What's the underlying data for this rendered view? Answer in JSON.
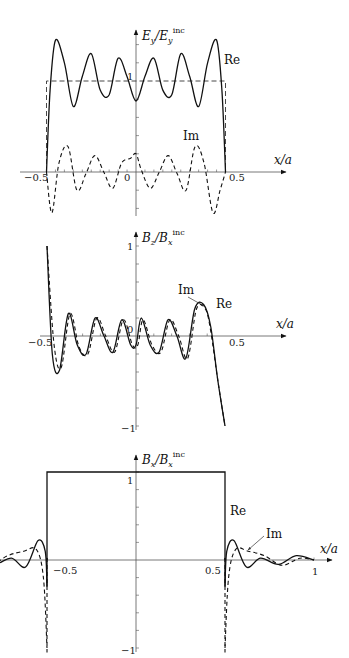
{
  "chart_data": [
    {
      "type": "line",
      "title": "",
      "ylabel": "E_y/E_y^inc",
      "ylabel_main": "E",
      "ylabel_sub": "y",
      "ylabel_den": "/E",
      "ylabel_den_sub": "y",
      "ylabel_sup": "inc",
      "xlabel": "x/a",
      "xticks": [
        "-0.5",
        "0",
        "0.5"
      ],
      "yticks": [
        "1"
      ],
      "xlim": [
        -0.5,
        0.5
      ],
      "ylim": [
        -0.5,
        1.55
      ],
      "reference": {
        "name": "incident",
        "style": "dashed",
        "value": 1,
        "x_range": [
          -0.5,
          0.5
        ]
      },
      "series": [
        {
          "name": "Re",
          "style": "solid",
          "x": [
            -0.5,
            -0.48,
            -0.45,
            -0.4,
            -0.35,
            -0.3,
            -0.25,
            -0.2,
            -0.15,
            -0.1,
            -0.05,
            0,
            0.05,
            0.1,
            0.15,
            0.2,
            0.25,
            0.3,
            0.35,
            0.4,
            0.45,
            0.48,
            0.5
          ],
          "values": [
            0,
            0.9,
            1.45,
            1.2,
            0.72,
            1.05,
            1.3,
            0.9,
            0.85,
            1.25,
            1.05,
            0.78,
            1.05,
            1.25,
            0.9,
            0.85,
            1.3,
            1.05,
            0.72,
            1.2,
            1.45,
            0.9,
            0
          ]
        },
        {
          "name": "Im",
          "style": "dashed",
          "x": [
            -0.5,
            -0.47,
            -0.43,
            -0.38,
            -0.33,
            -0.28,
            -0.23,
            -0.18,
            -0.13,
            -0.08,
            -0.03,
            0,
            0.03,
            0.08,
            0.13,
            0.18,
            0.23,
            0.28,
            0.33,
            0.38,
            0.43,
            0.47,
            0.5
          ],
          "values": [
            0,
            -0.45,
            0.1,
            0.28,
            -0.2,
            -0.02,
            0.18,
            0.0,
            -0.18,
            0.1,
            0.15,
            0.2,
            0.02,
            -0.18,
            0.0,
            0.18,
            -0.02,
            -0.2,
            0.28,
            0.1,
            -0.45,
            -0.2,
            0
          ]
        }
      ]
    },
    {
      "type": "line",
      "title": "",
      "ylabel": "B_z/B_x^inc",
      "ylabel_main": "B",
      "ylabel_sub": "z",
      "ylabel_den": "/B",
      "ylabel_den_sub": "x",
      "ylabel_sup": "inc",
      "xlabel": "x/a",
      "xticks": [
        "-0.5",
        "0",
        "0.5"
      ],
      "yticks": [
        "1",
        "-1"
      ],
      "xlim": [
        -0.5,
        0.5
      ],
      "ylim": [
        -1,
        1
      ],
      "annotations": [
        {
          "text": "Im",
          "arrow": true
        },
        {
          "text": "Re"
        }
      ],
      "series": [
        {
          "name": "Re",
          "style": "solid",
          "x": [
            -0.5,
            -0.47,
            -0.43,
            -0.38,
            -0.33,
            -0.28,
            -0.23,
            -0.18,
            -0.13,
            -0.08,
            -0.03,
            0.0,
            0.03,
            0.08,
            0.13,
            0.18,
            0.23,
            0.28,
            0.33,
            0.38,
            0.42,
            0.46,
            0.5
          ],
          "values": [
            1.0,
            -0.2,
            -0.38,
            0.25,
            -0.1,
            -0.2,
            0.2,
            0.0,
            -0.18,
            0.18,
            -0.1,
            -0.1,
            0.2,
            -0.1,
            -0.18,
            0.18,
            0.0,
            -0.25,
            0.3,
            0.35,
            0.1,
            -0.5,
            -1.0
          ]
        },
        {
          "name": "Im",
          "style": "dashed",
          "x": [
            -0.5,
            -0.46,
            -0.42,
            -0.37,
            -0.32,
            -0.27,
            -0.22,
            -0.17,
            -0.12,
            -0.07,
            -0.02,
            0.01,
            0.04,
            0.09,
            0.14,
            0.19,
            0.24,
            0.29,
            0.34,
            0.39,
            0.42,
            0.46,
            0.5
          ],
          "values": [
            1.0,
            -0.1,
            -0.35,
            0.25,
            -0.12,
            -0.2,
            0.2,
            0.0,
            -0.18,
            0.18,
            -0.1,
            -0.1,
            0.18,
            -0.1,
            -0.18,
            0.18,
            0.0,
            -0.25,
            0.3,
            0.3,
            0.05,
            -0.5,
            -1.0
          ]
        }
      ]
    },
    {
      "type": "line",
      "title": "",
      "ylabel": "B_x/B_x^inc",
      "ylabel_main": "B",
      "ylabel_sub": "x",
      "ylabel_den": "/B",
      "ylabel_den_sub": "x",
      "ylabel_sup": "inc",
      "xlabel": "x/a",
      "xticks": [
        "-0.5",
        "0.5",
        "1"
      ],
      "yticks": [
        "1",
        "-1"
      ],
      "xlim": [
        -1,
        1
      ],
      "ylim": [
        -1,
        1.05
      ],
      "reference": {
        "name": "incident",
        "style": "solid",
        "value": 1,
        "x_range": [
          -0.5,
          0.5
        ]
      },
      "annotations": [
        {
          "text": "Re"
        },
        {
          "text": "Im",
          "arrow": true
        }
      ],
      "series": [
        {
          "name": "Re",
          "style": "solid",
          "x": [
            -1.0,
            -0.9,
            -0.8,
            -0.7,
            -0.62,
            -0.55,
            -0.51,
            -0.5,
            0.5,
            0.51,
            0.55,
            0.62,
            0.7,
            0.8,
            0.9,
            1.0
          ],
          "values": [
            0.0,
            0.05,
            -0.05,
            0.02,
            -0.08,
            0.22,
            0.1,
            -0.3,
            -0.3,
            0.1,
            0.22,
            -0.08,
            0.02,
            -0.05,
            0.05,
            0.0
          ]
        },
        {
          "name": "Im",
          "style": "dashed",
          "x": [
            -1.0,
            -0.92,
            -0.82,
            -0.72,
            -0.63,
            -0.56,
            -0.52,
            -0.5,
            0.5,
            0.52,
            0.56,
            0.63,
            0.72,
            0.82,
            0.92,
            1.0
          ],
          "values": [
            0.0,
            0.02,
            -0.06,
            0.05,
            0.1,
            0.12,
            -0.2,
            -1.0,
            -1.0,
            -0.2,
            0.12,
            0.1,
            0.05,
            -0.06,
            0.02,
            0.0
          ]
        }
      ]
    }
  ],
  "labels": {
    "xaxis": "x/a",
    "re": "Re",
    "im": "Im",
    "p1": {
      "xm05": "−0.5",
      "x0": "0",
      "x05": "0.5",
      "y1": "1"
    },
    "p2": {
      "xm05": "−0.5",
      "x0": "0",
      "x05": "0.5",
      "y1": "1",
      "ym1": "−1"
    },
    "p3": {
      "xm05": "−0.5",
      "x05": "0.5",
      "x1": "1",
      "y1": "1",
      "ym1": "−1"
    }
  }
}
